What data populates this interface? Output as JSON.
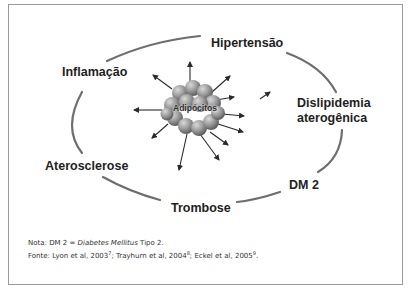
{
  "diagram": {
    "center_label": "Adipócitos",
    "outcomes": {
      "top": "Hipertensão",
      "upper_left": "Inflamação",
      "right_line1": "Dislipidemia",
      "right_line2": "aterogênica",
      "left": "Aterosclerose",
      "lower_right": "DM 2",
      "bottom": "Trombose"
    },
    "colors": {
      "ellipse_stroke": "#6e6e6e",
      "arrow": "#2a2a2a",
      "cell_fill": "#9a9a9a",
      "text": "#1e1e1e",
      "frame_border": "#9a9a9a"
    }
  },
  "footnotes": {
    "note_prefix": "Nota: DM 2 = ",
    "note_italic": "Diabetes Mellitus",
    "note_suffix": " Tipo 2.",
    "source_prefix": "Fonte: Lyon et al, 2003",
    "source_sup1": "7",
    "source_mid1": "; Trayhurn et al, 2004",
    "source_sup2": "8",
    "source_mid2": "; Eckel et al, 2005",
    "source_sup3": "9",
    "source_end": "."
  }
}
